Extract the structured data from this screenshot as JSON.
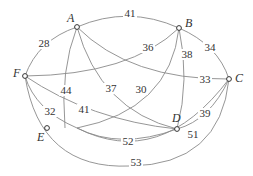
{
  "diagram": {
    "type": "weighted-graph",
    "nodes": [
      {
        "id": "A",
        "label": "A",
        "x": 77,
        "y": 27,
        "lx": 67,
        "ly": 22
      },
      {
        "id": "B",
        "label": "B",
        "x": 179,
        "y": 28,
        "lx": 185,
        "ly": 27
      },
      {
        "id": "C",
        "label": "C",
        "x": 229,
        "y": 79,
        "lx": 235,
        "ly": 82
      },
      {
        "id": "D",
        "label": "D",
        "x": 177,
        "y": 129,
        "lx": 172,
        "ly": 122
      },
      {
        "id": "E",
        "label": "E",
        "x": 47,
        "y": 128,
        "lx": 37,
        "ly": 141
      },
      {
        "id": "F",
        "label": "F",
        "x": 25,
        "y": 76,
        "lx": 13,
        "ly": 77
      }
    ],
    "edges": [
      {
        "from": "A",
        "to": "B",
        "weight": "41",
        "path": "M77,27 Q128,5 179,28",
        "lx": 130,
        "ly": 17
      },
      {
        "from": "A",
        "to": "F",
        "weight": "28",
        "path": "M77,27 Q38,40 25,76",
        "lx": 44,
        "ly": 47
      },
      {
        "from": "B",
        "to": "C",
        "weight": "34",
        "path": "M179,28 Q218,45 229,79",
        "lx": 210,
        "ly": 51
      },
      {
        "from": "A",
        "to": "C",
        "weight": "33",
        "path": "M77,27 Q130,80 229,79",
        "lx": 205,
        "ly": 83
      },
      {
        "from": "F",
        "to": "B",
        "weight": "36",
        "path": "M25,76 Q130,75 179,28",
        "lx": 148,
        "ly": 51
      },
      {
        "from": "A",
        "to": "E",
        "weight": "44",
        "path": "M77,27 Q60,70 65,128",
        "lx": 66,
        "ly": 94
      },
      {
        "from": "A",
        "to": "D",
        "weight": "37",
        "path": "M77,27 Q100,110 177,129",
        "lx": 111,
        "ly": 92
      },
      {
        "from": "B",
        "to": "E",
        "weight": "30",
        "path": "M179,28 Q170,110 77,128",
        "lx": 141,
        "ly": 93
      },
      {
        "from": "B",
        "to": "D",
        "weight": "38",
        "path": "M179,28 Q190,80 177,129",
        "lx": 187,
        "ly": 58
      },
      {
        "from": "F",
        "to": "D",
        "weight": "41",
        "path": "M25,76 Q90,120 177,129",
        "lx": 84,
        "ly": 113
      },
      {
        "from": "F",
        "to": "E",
        "weight": "32",
        "path": "M25,76 Q35,110 77,128",
        "lx": 50,
        "ly": 115
      },
      {
        "from": "C",
        "to": "D",
        "weight": "39",
        "path": "M229,79 Q210,120 177,129",
        "lx": 205,
        "ly": 117
      },
      {
        "from": "E",
        "to": "D",
        "weight": "52",
        "path": "M77,128 Q120,150 177,129",
        "lx": 128,
        "ly": 145
      },
      {
        "from": "E",
        "to": "C",
        "weight": "51",
        "path": "M77,128 Q160,170 229,79",
        "lx": 193,
        "ly": 138
      },
      {
        "from": "F",
        "to": "C",
        "weight": "53",
        "path": "M25,76 Q40,170 130,166 Q220,165 229,79",
        "lx": 136,
        "ly": 166
      }
    ]
  }
}
